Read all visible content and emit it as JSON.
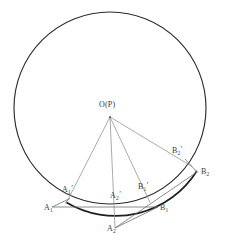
{
  "figure": {
    "type": "geometry-diagram",
    "canvas": {
      "width": 225,
      "height": 245,
      "background": "#ffffff"
    },
    "colors": {
      "circle_stroke": "#2b2b2b",
      "ray_stroke": "#8a8a8a",
      "chord_stroke": "#6e6e6e",
      "label_text": "#3a3a3a"
    },
    "circle": {
      "name": "main-circle",
      "center_x": 110,
      "center_y": 108,
      "radius": 96,
      "center_label": "O(P)"
    },
    "points": [
      {
        "id": "O",
        "label": "O(P)",
        "x": 110,
        "y": 117,
        "label_x": 99,
        "label_y": 101,
        "sub": "",
        "prime": false
      },
      {
        "id": "A1",
        "label": "A",
        "x": 52,
        "y": 207,
        "label_x": 44,
        "label_y": 208,
        "sub": "1",
        "prime": false
      },
      {
        "id": "A1p",
        "label": "A",
        "x": 69.5,
        "y": 198.5,
        "label_x": 63,
        "label_y": 189,
        "sub": "1",
        "prime": true
      },
      {
        "id": "A2",
        "label": "A",
        "x": 115,
        "y": 228,
        "label_x": 108,
        "label_y": 229,
        "sub": "2",
        "prime": false
      },
      {
        "id": "A2p",
        "label": "A",
        "x": 110,
        "y": 204,
        "label_x": 112,
        "label_y": 195,
        "sub": "2",
        "prime": true
      },
      {
        "id": "B1",
        "label": "B",
        "x": 158,
        "y": 207,
        "label_x": 161,
        "label_y": 208,
        "sub": "1",
        "prime": false
      },
      {
        "id": "B1p",
        "label": "B",
        "x": 146.5,
        "y": 196.5,
        "label_x": 139,
        "label_y": 186,
        "sub": "1",
        "prime": true
      },
      {
        "id": "B2",
        "label": "B",
        "x": 197,
        "y": 172,
        "label_x": 201,
        "label_y": 172,
        "sub": "2",
        "prime": false
      },
      {
        "id": "B2p",
        "label": "B",
        "x": 185,
        "y": 159,
        "label_x": 173,
        "label_y": 150,
        "sub": "2",
        "prime": true
      }
    ],
    "rays": [
      {
        "name": "ray-O-A1p",
        "from": "O",
        "to": "A1p",
        "x1": 110,
        "y1": 117,
        "x2": 66,
        "y2": 203
      },
      {
        "name": "ray-O-A2",
        "from": "O",
        "to": "A2",
        "x1": 110,
        "y1": 117,
        "x2": 115,
        "y2": 228
      },
      {
        "name": "ray-O-B1p",
        "from": "O",
        "to": "B1p",
        "x1": 110,
        "y1": 117,
        "x2": 150,
        "y2": 202
      },
      {
        "name": "ray-O-B2p",
        "from": "O",
        "to": "B2p",
        "x1": 110,
        "y1": 117,
        "x2": 191,
        "y2": 166
      }
    ],
    "segments": [
      {
        "name": "baseline-A1-B1",
        "x1": 52,
        "y1": 207,
        "x2": 158,
        "y2": 207
      },
      {
        "name": "segment-A2-B1",
        "x1": 115,
        "y1": 228,
        "x2": 158,
        "y2": 207
      },
      {
        "name": "segment-A2-B2",
        "x1": 115,
        "y1": 228,
        "x2": 197,
        "y2": 172
      },
      {
        "name": "segment-B2p-B2",
        "x1": 185,
        "y1": 159,
        "x2": 197,
        "y2": 172
      },
      {
        "name": "segment-A1-A1p",
        "x1": 52,
        "y1": 207,
        "x2": 69,
        "y2": 199
      }
    ],
    "tangent_arc": {
      "name": "tangent-arc-A1-B2",
      "description": "heavy arc running from lower-left A1' through A2' and B1' to B2"
    }
  }
}
